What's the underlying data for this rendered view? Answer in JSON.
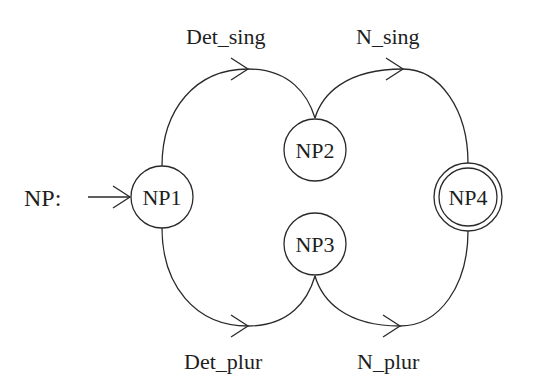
{
  "diagram": {
    "title_label": "NP:",
    "nodes": [
      {
        "id": "NP1",
        "label": "NP1",
        "type": "initial"
      },
      {
        "id": "NP2",
        "label": "NP2",
        "type": "state"
      },
      {
        "id": "NP3",
        "label": "NP3",
        "type": "state"
      },
      {
        "id": "NP4",
        "label": "NP4",
        "type": "final"
      }
    ],
    "edges": [
      {
        "from": "NP1",
        "to": "NP2",
        "label": "Det_sing"
      },
      {
        "from": "NP2",
        "to": "NP4",
        "label": "N_sing"
      },
      {
        "from": "NP1",
        "to": "NP3",
        "label": "Det_plur"
      },
      {
        "from": "NP3",
        "to": "NP4",
        "label": "N_plur"
      }
    ],
    "colors": {
      "stroke": "#2a2a2a",
      "text": "#1e1e1e",
      "background": "#ffffff"
    }
  }
}
